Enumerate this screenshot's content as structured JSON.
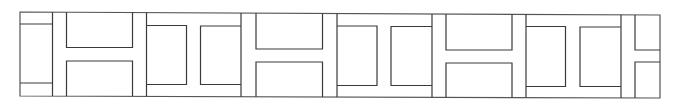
{
  "diagram": {
    "type": "geometric-frieze-pattern",
    "stroke_color": "#3a3a3a",
    "background": "#ffffff",
    "frame": {
      "x1": 20,
      "y1": 12,
      "x2": 660,
      "y2": 96,
      "top_right_y": 15,
      "bottom_right_y": 98
    },
    "dividers_x": [
      52.5,
      146.5,
      241,
      337,
      432,
      526,
      621
    ],
    "left_partial": {
      "x1": 20,
      "x2": 52.5,
      "horizontal_lines_y": [
        24,
        83
      ]
    },
    "right_partial": {
      "x1": 621,
      "x2": 660,
      "inner_x": 635,
      "horizontal_lines_y": [
        50,
        62
      ]
    },
    "motifs": [
      {
        "kind": "H",
        "x1": 52.5,
        "x2": 146.5,
        "inner_left": 66.5,
        "inner_right": 132.5,
        "top_box_bottom": 47.5,
        "bottom_box_top": 61
      },
      {
        "kind": "vertical-H",
        "x1": 146.5,
        "x2": 241,
        "left_box_right": 186.5,
        "right_box_left": 200.5,
        "box_top": 25.5,
        "box_bottom": 84.5
      },
      {
        "kind": "H",
        "x1": 241,
        "x2": 337,
        "inner_left": 256,
        "inner_right": 322.5,
        "top_box_bottom": 49,
        "bottom_box_top": 62
      },
      {
        "kind": "vertical-H",
        "x1": 337,
        "x2": 432,
        "left_box_right": 377,
        "right_box_left": 391,
        "box_top": 26,
        "box_bottom": 85.5
      },
      {
        "kind": "H",
        "x1": 432,
        "x2": 526,
        "inner_left": 446,
        "inner_right": 512,
        "top_box_bottom": 50,
        "bottom_box_top": 63
      },
      {
        "kind": "vertical-H",
        "x1": 526,
        "x2": 621,
        "left_box_right": 565.5,
        "right_box_left": 580,
        "box_top": 26.5,
        "box_bottom": 86.5
      }
    ]
  }
}
